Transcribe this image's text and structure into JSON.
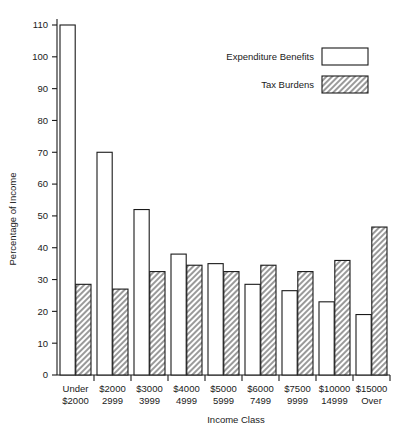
{
  "chart_data": {
    "type": "bar",
    "title": "",
    "xlabel": "Income Class",
    "ylabel": "Percentage of Income",
    "ylim": [
      0,
      110
    ],
    "ytick_step": 10,
    "yticks": [
      "0",
      "10",
      "20",
      "30",
      "40",
      "50",
      "60",
      "70",
      "80",
      "90",
      "100",
      "110"
    ],
    "grid": false,
    "legend_position": "top-right",
    "categories": [
      "Under\n$2000",
      "$2000\n2999",
      "$3000\n3999",
      "$4000\n4999",
      "$5000\n5999",
      "$6000\n7499",
      "$7500\n9999",
      "$10000\n14999",
      "$15000\nOver"
    ],
    "category_lines": [
      [
        "Under",
        "$2000"
      ],
      [
        "$2000",
        "2999"
      ],
      [
        "$3000",
        "3999"
      ],
      [
        "$4000",
        "4999"
      ],
      [
        "$5000",
        "5999"
      ],
      [
        "$6000",
        "7499"
      ],
      [
        "$7500",
        "9999"
      ],
      [
        "$10000",
        "14999"
      ],
      [
        "$15000",
        "Over"
      ]
    ],
    "series": [
      {
        "name": "Expenditure Benefits",
        "style": "open",
        "values": [
          110,
          70,
          52,
          38,
          35,
          28.5,
          26.5,
          23,
          19
        ]
      },
      {
        "name": "Tax Burdens",
        "style": "hatched",
        "values": [
          28.5,
          27,
          32.5,
          34.5,
          32.5,
          34.5,
          32.5,
          36,
          46.5
        ]
      }
    ]
  },
  "legend": {
    "entries": [
      {
        "label": "Expenditure Benefits",
        "style": "open"
      },
      {
        "label": "Tax Burdens",
        "style": "hatched"
      }
    ]
  },
  "colors": {
    "ink": "#1a1a1a",
    "background": "#ffffff",
    "hatch": "#8a8a8a"
  }
}
